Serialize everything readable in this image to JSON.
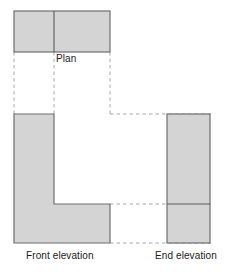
{
  "drawing": {
    "title": "Orthographic projection: Plan, Front elevation, End elevation",
    "type": "engineering-orthographic-projection",
    "projection": "third-angle-style layout",
    "canvas": {
      "width": 233,
      "height": 278
    },
    "colors": {
      "background": "#ffffff",
      "fill": "#d4d4d4",
      "outline": "#6e6e6e",
      "internal_line": "#5a5a5a",
      "projection_line": "#a8a8a8",
      "text": "#1a1a1a"
    },
    "labels": {
      "plan": "Plan",
      "front_elevation": "Front elevation",
      "end_elevation": "End elevation"
    },
    "views": [
      {
        "name": "plan",
        "label": "Plan",
        "shape": "rectangle",
        "filled": true,
        "x": 14,
        "y": 11,
        "width": 96,
        "height": 41,
        "internal_lines": [
          {
            "orientation": "vertical",
            "x": 54,
            "y1": 11,
            "y2": 52
          }
        ]
      },
      {
        "name": "front-elevation",
        "label": "Front elevation",
        "shape": "L-shape-notched-rectangle",
        "filled": true,
        "x": 14,
        "y": 114,
        "width": 96,
        "height": 129,
        "notch": {
          "x": 54,
          "y": 114,
          "width": 56,
          "height": 90
        },
        "outline_points": "14,114 54,114 54,204 110,204 110,243 14,243"
      },
      {
        "name": "end-elevation",
        "label": "End elevation",
        "shape": "rectangle",
        "filled": true,
        "x": 167,
        "y": 114,
        "width": 43,
        "height": 129,
        "internal_lines": [
          {
            "orientation": "horizontal",
            "y": 204,
            "x1": 167,
            "x2": 210
          }
        ]
      }
    ],
    "projection_lines": {
      "vertical": [
        {
          "name": "left-edge-projector",
          "x": 14,
          "y1": 52,
          "y2": 114
        },
        {
          "name": "step-projector",
          "x": 54,
          "y1": 52,
          "y2": 114
        },
        {
          "name": "right-edge-projector",
          "x": 110,
          "y1": 52,
          "y2": 114
        }
      ],
      "horizontal": [
        {
          "name": "top-projector",
          "y": 114,
          "x1": 110,
          "x2": 213
        },
        {
          "name": "step-height-projector",
          "y": 204,
          "x1": 110,
          "x2": 213
        },
        {
          "name": "base-projector",
          "y": 243,
          "x1": 110,
          "x2": 213
        }
      ]
    }
  }
}
